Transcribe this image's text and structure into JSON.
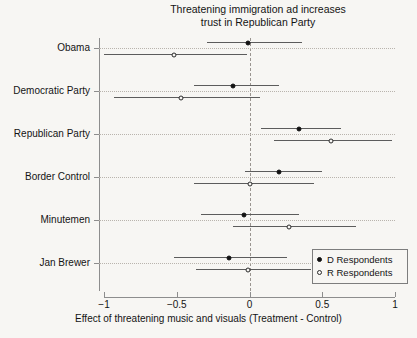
{
  "chart_data": {
    "type": "scatter",
    "title": "Threatening immigration ad increases\ntrust in Republican Party",
    "xlabel": "Effect of threatening music and visuals (Treatment - Control)",
    "ylabel": "",
    "xlim": [
      -1,
      1
    ],
    "xticks": [
      -1,
      -0.5,
      0,
      0.5,
      1
    ],
    "xtick_labels": [
      "−1",
      "−0.5",
      "0",
      "0.5",
      "1"
    ],
    "grid": true,
    "zero_reference_line": 0,
    "legend_position": "bottom-right",
    "categories": [
      "Obama",
      "Democratic Party",
      "Republican Party",
      "Border Control",
      "Minutemen",
      "Jan Brewer"
    ],
    "series": [
      {
        "name": "D Respondents",
        "marker": "filled-circle",
        "values": [
          -0.01,
          -0.11,
          0.34,
          0.2,
          -0.04,
          -0.14
        ],
        "ci_low": [
          -0.29,
          -0.38,
          0.08,
          -0.03,
          -0.33,
          -0.52
        ],
        "ci_high": [
          0.36,
          0.2,
          0.63,
          0.5,
          0.34,
          0.26
        ]
      },
      {
        "name": "R Respondents",
        "marker": "open-circle",
        "values": [
          -0.52,
          -0.47,
          0.56,
          0.0,
          0.27,
          -0.01
        ],
        "ci_low": [
          -1.0,
          -0.93,
          0.17,
          -0.38,
          -0.11,
          -0.37
        ],
        "ci_high": [
          -0.02,
          0.07,
          0.98,
          0.44,
          0.73,
          0.42
        ]
      }
    ]
  },
  "legend": {
    "items": [
      {
        "label": "D Respondents",
        "marker": "filled"
      },
      {
        "label": "R Respondents",
        "marker": "open"
      }
    ]
  }
}
